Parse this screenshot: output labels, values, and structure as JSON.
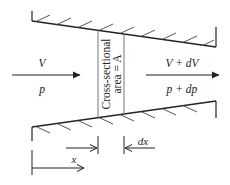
{
  "diagram": {
    "type": "converging duct / flow through variable-area channel",
    "inlet": {
      "velocity_label": "V",
      "pressure_label": "p"
    },
    "outlet": {
      "velocity_label": "V + dV",
      "pressure_label": "p + dp"
    },
    "section": {
      "line1": "Cross-sectional",
      "line2": "area = A"
    },
    "dimensions": {
      "element_length_label": "dx",
      "position_label": "x"
    },
    "colors": {
      "stroke": "#222222",
      "section_line": "#777777",
      "background": "#ffffff"
    }
  }
}
